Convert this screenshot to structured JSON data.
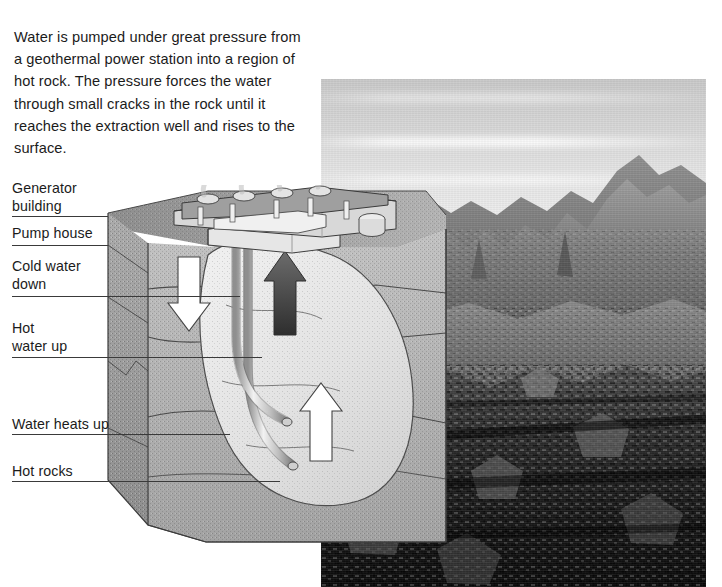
{
  "intro": {
    "paragraph": "Water is pumped under great pressure from a geothermal power station into a region of hot rock. The pressure forces the water through small cracks in the rock until it reaches the extraction well and rises to the surface."
  },
  "diagram": {
    "labels": [
      {
        "id": "generator-building",
        "text": "Generator\nbuilding",
        "x": 12,
        "y": 180,
        "leader_y": 216,
        "leader_x": 12,
        "leader_w": 96
      },
      {
        "id": "pump-house",
        "text": "Pump house",
        "x": 12,
        "y": 225,
        "leader_y": 245,
        "leader_x": 12,
        "leader_w": 96
      },
      {
        "id": "cold-water-down",
        "text": "Cold water\ndown",
        "x": 12,
        "y": 258,
        "leader_y": 296,
        "leader_x": 12,
        "leader_w": 228
      },
      {
        "id": "hot-water-up",
        "text": "Hot\nwater up",
        "x": 12,
        "y": 320,
        "leader_y": 357,
        "leader_x": 12,
        "leader_w": 250
      },
      {
        "id": "water-heats-up",
        "text": "Water heats up",
        "x": 12,
        "y": 416,
        "leader_y": 434,
        "leader_x": 12,
        "leader_w": 218
      },
      {
        "id": "hot-rocks",
        "text": "Hot rocks",
        "x": 12,
        "y": 463,
        "leader_y": 481,
        "leader_x": 12,
        "leader_w": 268
      }
    ],
    "flow_arrows": [
      {
        "id": "cold-water-down-arrow",
        "direction": "down",
        "fill": "#ffffff"
      },
      {
        "id": "hot-water-up-arrow",
        "direction": "up",
        "fill": "#4a4a4a"
      },
      {
        "id": "water-heats-up-arrow",
        "direction": "up",
        "fill": "#ffffff"
      }
    ],
    "strata": [
      {
        "id": "topsoil",
        "fill": "#9a9a9a"
      },
      {
        "id": "upper-rock",
        "fill": "#b8b8b8"
      },
      {
        "id": "mid-rock",
        "fill": "#a5a5a5"
      },
      {
        "id": "deep-hot-rock",
        "fill": "#d7d7d7"
      }
    ]
  },
  "photo": {
    "id": "geothermal-lava-field-photo",
    "caption": "",
    "description": "black and white photograph of a rugged volcanic lava field with rocky mountain ridges on the horizon"
  },
  "colors": {
    "ink": "#1b1b1b",
    "leader": "#3a3a3a",
    "page_bg": "#ffffff",
    "rock_light": "#d7d7d7",
    "rock_mid": "#a5a5a5",
    "rock_dark": "#7b7b7b",
    "pipe": "#c9c9c9"
  }
}
